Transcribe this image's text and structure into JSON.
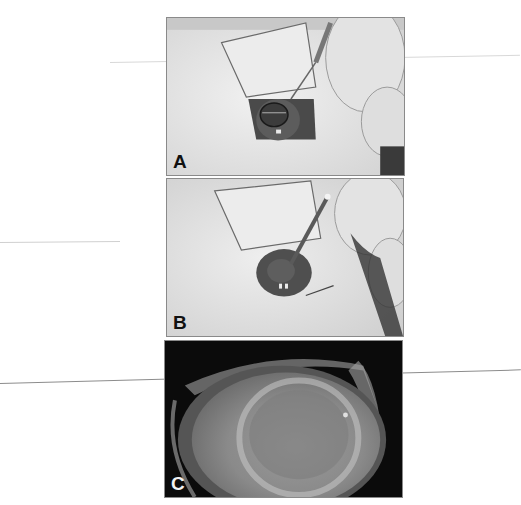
{
  "figure": {
    "panels": [
      {
        "label": "A",
        "description": "eye with retractor and forceps holding ring on cornea"
      },
      {
        "label": "B",
        "description": "eye with retractor and instrument inserted at cornea center"
      },
      {
        "label": "C",
        "description": "slit-lamp close-up of eye with hazy cornea"
      }
    ]
  }
}
